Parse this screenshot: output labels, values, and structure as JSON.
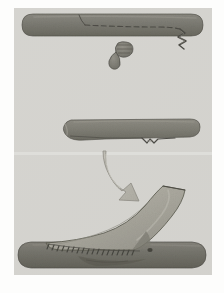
{
  "figure": {
    "title": "Surgical flap elevation and inset — three stage illustration",
    "medium": "printed halftone illustration on paper",
    "panel_count": 3,
    "border": {
      "paper_color": "#fdfdfc",
      "inner_background_color": "#d7d6d2",
      "inset_left": 14,
      "inset_top": 8,
      "inset_right": 12,
      "inset_bottom": 18
    },
    "colors": {
      "background": "#d7d6d2",
      "background_light": "#dedcd8",
      "tissue_dark": "#7b7a72",
      "tissue_dark_shadow": "#67665f",
      "tissue_mid": "#8d8b81",
      "flap_light": "#a6a49a",
      "flap_light_hi": "#b3b1a7",
      "outline": "#4a4943",
      "incision_line": "#55544e",
      "suture_line": "#4f4e48",
      "arrow_fill": "#b9b7ae",
      "arrow_outline": "#8a8880",
      "paper_white": "#fdfdfc"
    }
  },
  "panels": [
    {
      "id": "panel-top",
      "index": 1,
      "label": "Stage 1 — incision marked on donor strip, small excised fragment below",
      "elements": [
        {
          "name": "donor-tissue-strip",
          "description": "horizontal rounded dark tissue bar spanning panel width"
        },
        {
          "name": "incision-dashed-line",
          "description": "dashed planned incision running along strip toward right"
        },
        {
          "name": "incision-solid-line",
          "description": "solid vertical cut mark at left end of dashed run"
        },
        {
          "name": "flap-pedicle-notch",
          "description": "zig-zag notch cut at right end of strip underside"
        },
        {
          "name": "excised-fragment",
          "description": "small detached oval tissue fragment below the strip"
        }
      ]
    },
    {
      "id": "panel-middle",
      "index": 2,
      "label": "Stage 2 — strip after flap elevation, defect edge visible",
      "elements": [
        {
          "name": "elevated-tissue-strip",
          "description": "horizontal dark tissue bar, shorter, tapered left tip"
        },
        {
          "name": "undermined-edge-line",
          "description": "thin line along lower border showing undermined plane"
        },
        {
          "name": "pedicle-step-notch",
          "description": "step notch on lower right edge"
        }
      ]
    },
    {
      "id": "panel-bottom",
      "index": 3,
      "label": "Stage 3 — flap rotated upward and sutured into recipient bed",
      "elements": [
        {
          "name": "recipient-bed-strip",
          "description": "horizontal dark tissue bar forming the base"
        },
        {
          "name": "rotated-flap",
          "description": "light tissue flap angled up and to the right at about 40 degrees"
        },
        {
          "name": "suture-line",
          "description": "row of short stitch marks along flap-to-bed junction"
        },
        {
          "name": "flap-base-shadow",
          "description": "darker shading where flap meets the bed"
        }
      ]
    }
  ],
  "annotations": {
    "transfer_arrow": {
      "name": "transfer-arrow",
      "description": "curved gray arrow between middle and bottom panels indicating direction of flap transfer",
      "direction": "down-right",
      "curve": "concave-right",
      "head_angle_degrees": 55
    }
  },
  "geometry": {
    "panel_top": {
      "strip": {
        "x": 22,
        "y": 14,
        "width": 180,
        "height": 22,
        "radius": 11
      },
      "fragment": {
        "cx": 122,
        "cy": 52,
        "rx": 6,
        "ry": 8
      }
    },
    "panel_middle": {
      "strip": {
        "x": 62,
        "y": 120,
        "width": 138,
        "height": 20,
        "radius": 8
      }
    },
    "panel_bottom": {
      "bed": {
        "x": 18,
        "y": 242,
        "width": 188,
        "height": 26,
        "radius": 13
      },
      "flap_angle_degrees": 40
    },
    "arrow": {
      "start_x": 108,
      "start_y": 150,
      "end_x": 138,
      "end_y": 196
    }
  },
  "meta": {
    "width": 224,
    "height": 293
  }
}
